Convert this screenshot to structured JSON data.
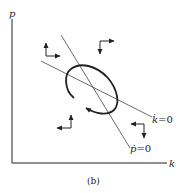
{
  "diagram": {
    "caption": "(b)",
    "axes": {
      "y_label": "p",
      "x_label": "k"
    },
    "loci": {
      "k_dot_zero": {
        "label": "k̇ = 0",
        "label_var": "k̇",
        "label_eq": "=0"
      },
      "p_dot_zero": {
        "label": "ṗ = 0",
        "label_var": "ṗ",
        "label_eq": "=0"
      }
    },
    "trajectory": "closed orbit (cycle) around equilibrium, counter-clockwise arrow",
    "direction_arrows": [
      {
        "region": "upper-left",
        "directions": [
          "up",
          "right"
        ]
      },
      {
        "region": "upper-right",
        "directions": [
          "right",
          "down"
        ]
      },
      {
        "region": "lower-left",
        "directions": [
          "up",
          "left"
        ]
      },
      {
        "region": "lower-right",
        "directions": [
          "left",
          "down"
        ]
      }
    ],
    "colors": {
      "ink": "#222222",
      "background": "#ffffff"
    }
  }
}
